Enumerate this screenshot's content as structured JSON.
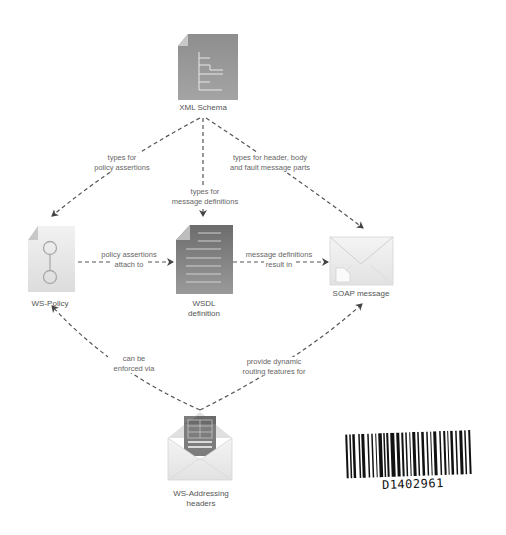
{
  "diagram": {
    "nodes": [
      {
        "id": "xml-schema",
        "label": "XML Schema",
        "icon": "schema-document-icon"
      },
      {
        "id": "ws-policy",
        "label": "WS-Policy",
        "icon": "policy-document-icon"
      },
      {
        "id": "wsdl",
        "label_line1": "WSDL",
        "label_line2": "definition",
        "icon": "wsdl-document-icon"
      },
      {
        "id": "soap",
        "label": "SOAP message",
        "icon": "envelope-icon"
      },
      {
        "id": "ws-addressing",
        "label_line1": "WS-Addressing",
        "label_line2": "headers",
        "icon": "open-envelope-icon"
      }
    ],
    "edges": [
      {
        "from": "xml-schema",
        "to": "ws-policy",
        "line1": "types for",
        "line2": "policy assertions"
      },
      {
        "from": "xml-schema",
        "to": "wsdl",
        "line1": "types for",
        "line2": "message definitions"
      },
      {
        "from": "xml-schema",
        "to": "soap",
        "line1": "types for header, body",
        "line2": "and fault message parts"
      },
      {
        "from": "ws-policy",
        "to": "wsdl",
        "line1": "policy assertions",
        "line2": "attach to"
      },
      {
        "from": "wsdl",
        "to": "soap",
        "line1": "message definitions",
        "line2": "result in"
      },
      {
        "from": "ws-addressing",
        "to": "ws-policy",
        "line1": "can be",
        "line2": "enforced via"
      },
      {
        "from": "ws-addressing",
        "to": "soap",
        "line1": "provide dynamic",
        "line2": "routing features for"
      }
    ],
    "colors": {
      "edge": "#555555",
      "doc_dark": "#7a7a7a",
      "doc_light": "#e4e4e4",
      "envelope": "#ececec"
    }
  },
  "barcode": {
    "text": "D1402961"
  }
}
